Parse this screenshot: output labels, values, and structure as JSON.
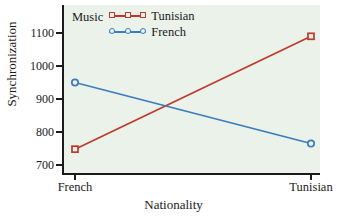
{
  "chart_data": {
    "type": "line",
    "title": "",
    "xlabel": "Nationality",
    "ylabel": "Synchronization",
    "categories": [
      "French",
      "Tunisian"
    ],
    "xtick_labels": [
      "French",
      "Tunisian"
    ],
    "ytick_labels": [
      "700",
      "800",
      "900",
      "1000",
      "1100"
    ],
    "yticks": [
      700,
      800,
      900,
      1000,
      1100
    ],
    "ylim": [
      680,
      1140
    ],
    "grid": false,
    "legend_position": "top-left-inside",
    "legend_title": "Music",
    "series": [
      {
        "name": "Tunisian",
        "values": [
          748,
          1090
        ],
        "color": "#c0392b",
        "marker": "square"
      },
      {
        "name": "French",
        "values": [
          950,
          765
        ],
        "color": "#3a7cbe",
        "marker": "circle"
      }
    ],
    "panel_background": "#eaf2ea",
    "figure_background": "#ffffff",
    "axis_color": "#1a1a1a"
  },
  "axes": {
    "y_label": "Synchronization",
    "x_label": "Nationality"
  },
  "legend": {
    "title": "Music",
    "entries": [
      {
        "label": "Tunisian",
        "color": "#c0392b"
      },
      {
        "label": "French",
        "color": "#3a7cbe"
      }
    ]
  }
}
